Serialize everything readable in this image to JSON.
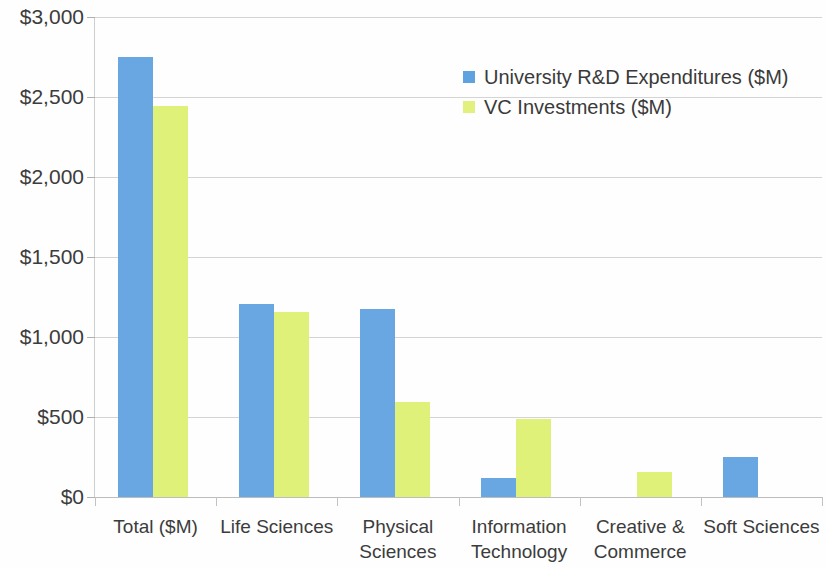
{
  "chart_data": {
    "type": "bar",
    "title": "",
    "subtitle": "",
    "xlabel": "",
    "ylabel": "",
    "grid": true,
    "legend_position": "top-right",
    "ylim": [
      0,
      3000
    ],
    "ytick_step": 500,
    "ytick_labels": [
      "$3,000",
      "$2,500",
      "$2,000",
      "$1,500",
      "$1,000",
      "$500",
      "$0"
    ],
    "ytick_values": [
      3000,
      2500,
      2000,
      1500,
      1000,
      500,
      0
    ],
    "categories": [
      "Total ($M)",
      "Life Sciences",
      "Physical Sciences",
      "Information Technology",
      "Creative & Commerce",
      "Soft Sciences"
    ],
    "series": [
      {
        "name": "University R&D Expenditures ($M)",
        "color": "#69A7E2",
        "values": [
          2750,
          1205,
          1175,
          120,
          0,
          250
        ]
      },
      {
        "name": "VC Investments ($M)",
        "color": "#DFF179",
        "values": [
          2445,
          1155,
          595,
          490,
          155,
          0
        ]
      }
    ]
  },
  "legend": {
    "items": [
      {
        "label": "University R&D Expenditures ($M)",
        "swatch": "#5FA2E0"
      },
      {
        "label": "VC Investments ($M)",
        "swatch": "#E2F07E"
      }
    ]
  },
  "axis_colors": {
    "gridline": "#d4d4d4",
    "axis": "#c2c2c2",
    "text": "#3c3c3c"
  }
}
